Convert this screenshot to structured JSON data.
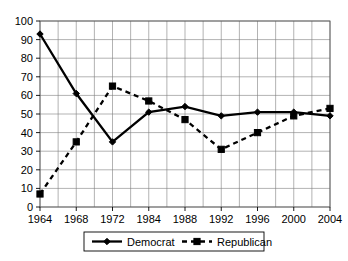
{
  "chart_data": {
    "type": "line",
    "title": "",
    "xlabel": "",
    "ylabel": "",
    "ylim": [
      0,
      100
    ],
    "ytick_step": 10,
    "yticks": [
      "0",
      "10",
      "20",
      "30",
      "40",
      "50",
      "60",
      "70",
      "80",
      "90",
      "100"
    ],
    "categories": [
      "1964",
      "1968",
      "1972",
      "1984",
      "1988",
      "1992",
      "1996",
      "2000",
      "2004"
    ],
    "grid": true,
    "grid_minor_x": true,
    "legend_position": "bottom",
    "series": [
      {
        "name": "Democrat",
        "marker": "diamond",
        "line_style": "solid",
        "color": "#000000",
        "values": [
          93,
          61,
          35,
          51,
          54,
          49,
          51,
          51,
          49
        ]
      },
      {
        "name": "Republican",
        "marker": "square",
        "line_style": "dashed",
        "color": "#000000",
        "values": [
          7,
          35,
          65,
          57,
          47,
          31,
          40,
          49,
          53
        ]
      }
    ]
  },
  "legend": {
    "entries": [
      {
        "label": "Democrat"
      },
      {
        "label": "Republican"
      }
    ]
  }
}
